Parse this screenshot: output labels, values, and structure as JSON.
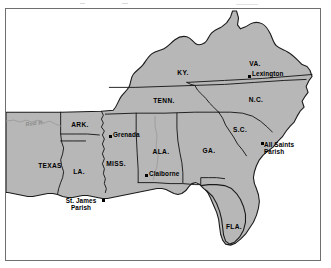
{
  "figure": {
    "kind": "reference-map",
    "region_title": "Southeastern United States",
    "land_color": "#b7b7b7",
    "water_color": "#ffffff",
    "border_color": "#1a1a1a",
    "frame_color": "#6f6f6f",
    "river_color": "#9a9a9a",
    "label_color": "#000000",
    "river_label_color": "#8b8b8b"
  },
  "states": [
    {
      "id": "texas",
      "label": "TEXAS",
      "x": 44,
      "y": 157
    },
    {
      "id": "arkansas",
      "label": "ARK.",
      "x": 74,
      "y": 116
    },
    {
      "id": "louisiana",
      "label": "LA.",
      "x": 73,
      "y": 163
    },
    {
      "id": "mississippi",
      "label": "MISS.",
      "x": 110,
      "y": 155
    },
    {
      "id": "alabama",
      "label": "ALA.",
      "x": 155,
      "y": 143
    },
    {
      "id": "tennessee",
      "label": "TENN.",
      "x": 158,
      "y": 92
    },
    {
      "id": "kentucky",
      "label": "KY.",
      "x": 177,
      "y": 64
    },
    {
      "id": "virginia",
      "label": "VA.",
      "x": 249,
      "y": 55
    },
    {
      "id": "north-carolina",
      "label": "N.C.",
      "x": 250,
      "y": 91
    },
    {
      "id": "south-carolina",
      "label": "S.C.",
      "x": 234,
      "y": 121
    },
    {
      "id": "georgia",
      "label": "GA.",
      "x": 203,
      "y": 142
    },
    {
      "id": "florida",
      "label": "FLA.",
      "x": 228,
      "y": 218
    }
  ],
  "rivers": [
    {
      "id": "red-river",
      "label": "Red R.",
      "x": 29,
      "y": 115
    }
  ],
  "places": [
    {
      "id": "lexington",
      "label": "Lexington",
      "lines": [
        "Lexington"
      ],
      "dot_x": 242,
      "dot_y": 66,
      "text_x": 246,
      "text_y": 62,
      "text_align": "left"
    },
    {
      "id": "grenada",
      "label": "Grenada",
      "lines": [
        "Grenada"
      ],
      "dot_x": 103,
      "dot_y": 126,
      "text_x": 107,
      "text_y": 123,
      "text_align": "left"
    },
    {
      "id": "claiborne",
      "label": "Claiborne",
      "lines": [
        "Claiborne"
      ],
      "dot_x": 139,
      "dot_y": 165,
      "text_x": 143,
      "text_y": 162,
      "text_align": "left"
    },
    {
      "id": "all-saints-parish",
      "label": "All Saints Parish",
      "lines": [
        "All Saints",
        "Parish"
      ],
      "dot_x": 255,
      "dot_y": 133,
      "text_x": 258,
      "text_y": 132,
      "text_align": "left"
    },
    {
      "id": "st-james-parish",
      "label": "St. James Parish",
      "lines": [
        "St. James",
        "Parish"
      ],
      "dot_x": 96,
      "dot_y": 190,
      "text_x": 93,
      "text_y": 190,
      "text_align": "right"
    }
  ]
}
